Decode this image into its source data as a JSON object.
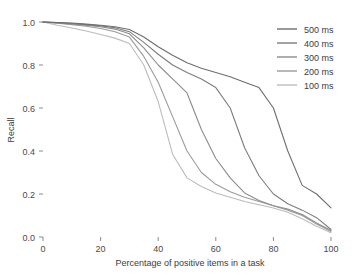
{
  "chart_data": {
    "type": "line",
    "title": "",
    "xlabel": "Percentage of positive items in a task",
    "ylabel": "Recall",
    "xlim": [
      0,
      100
    ],
    "ylim": [
      0.0,
      1.0
    ],
    "xticks": [
      0,
      20,
      40,
      60,
      80,
      100
    ],
    "yticks": [
      0.0,
      0.2,
      0.4,
      0.6,
      0.8,
      1.0
    ],
    "xticklabels": [
      "0",
      "20",
      "40",
      "60",
      "80",
      "100"
    ],
    "yticklabels": [
      "0.0",
      "0.2",
      "0.4",
      "0.6",
      "0.8",
      "1.0"
    ],
    "grid": false,
    "legend_position": "top-right",
    "x": [
      0,
      5,
      10,
      15,
      20,
      25,
      30,
      35,
      40,
      45,
      50,
      55,
      60,
      65,
      70,
      75,
      80,
      85,
      90,
      95,
      100
    ],
    "series": [
      {
        "name": "500 ms",
        "color": "#6e6e6e",
        "values": [
          1.0,
          0.998,
          0.995,
          0.99,
          0.985,
          0.978,
          0.965,
          0.93,
          0.885,
          0.845,
          0.81,
          0.785,
          0.765,
          0.745,
          0.72,
          0.695,
          0.6,
          0.4,
          0.24,
          0.2,
          0.135
        ]
      },
      {
        "name": "400 ms",
        "color": "#7d7d7d",
        "values": [
          1.0,
          0.997,
          0.993,
          0.988,
          0.982,
          0.973,
          0.955,
          0.905,
          0.85,
          0.8,
          0.765,
          0.735,
          0.695,
          0.6,
          0.415,
          0.285,
          0.2,
          0.155,
          0.125,
          0.09,
          0.035
        ]
      },
      {
        "name": "300 ms",
        "color": "#8c8c8c",
        "values": [
          1.0,
          0.996,
          0.991,
          0.985,
          0.978,
          0.967,
          0.945,
          0.88,
          0.8,
          0.735,
          0.67,
          0.5,
          0.365,
          0.275,
          0.205,
          0.17,
          0.145,
          0.13,
          0.105,
          0.065,
          0.03
        ]
      },
      {
        "name": "200 ms",
        "color": "#9b9b9b",
        "values": [
          1.0,
          0.994,
          0.988,
          0.98,
          0.97,
          0.955,
          0.93,
          0.84,
          0.72,
          0.56,
          0.4,
          0.3,
          0.245,
          0.21,
          0.185,
          0.165,
          0.145,
          0.125,
          0.1,
          0.06,
          0.025
        ]
      },
      {
        "name": "100 ms",
        "color": "#bcbcbc",
        "values": [
          1.0,
          0.985,
          0.972,
          0.958,
          0.942,
          0.925,
          0.9,
          0.8,
          0.63,
          0.385,
          0.275,
          0.235,
          0.205,
          0.185,
          0.165,
          0.15,
          0.135,
          0.115,
          0.085,
          0.05,
          0.02
        ]
      }
    ]
  },
  "plot_geometry": {
    "left": 43,
    "right": 331,
    "top": 22,
    "bottom": 237
  }
}
